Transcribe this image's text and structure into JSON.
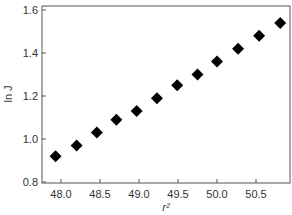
{
  "chart_data": {
    "type": "scatter",
    "title": "",
    "xlabel": "r²",
    "ylabel": "ln J",
    "xlim": [
      47.85,
      51.0
    ],
    "ylim": [
      0.8,
      1.6
    ],
    "xticks": [
      "48.0",
      "48.5",
      "49.0",
      "49.5",
      "50.0",
      "50.5"
    ],
    "yticks": [
      "0.8",
      "1.0",
      "1.2",
      "1.4",
      "1.6"
    ],
    "grid": false,
    "legend": null,
    "marker": "diamond",
    "marker_color": "#000000",
    "series": [
      {
        "name": "ln J vs r²",
        "x": [
          47.93,
          48.2,
          48.46,
          48.71,
          48.97,
          49.23,
          49.49,
          49.75,
          50.0,
          50.27,
          50.54,
          50.81
        ],
        "y": [
          0.92,
          0.97,
          1.03,
          1.09,
          1.13,
          1.19,
          1.25,
          1.3,
          1.36,
          1.42,
          1.48,
          1.54
        ]
      }
    ]
  }
}
